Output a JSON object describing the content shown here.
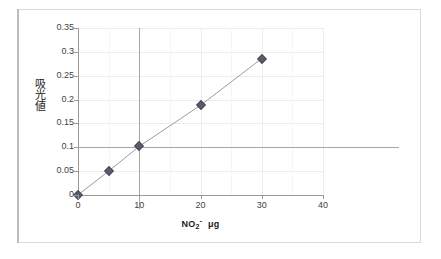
{
  "figure": {
    "background_color": "#ffffff",
    "frame_border_color": "#d9d9d9"
  },
  "chart_data": {
    "type": "line",
    "title": "",
    "subtitle": "",
    "xlabel": "NO2- μg",
    "xlabel_parts": {
      "base": "NO",
      "subscript": "2",
      "superscript": "-",
      "unit": "μg"
    },
    "ylabel": "吸光値",
    "x": [
      0,
      5,
      10,
      20,
      30
    ],
    "values": [
      0,
      0.05,
      0.102,
      0.188,
      0.286
    ],
    "series": [
      {
        "name": "吸光値",
        "x": [
          0,
          5,
          10,
          20,
          30
        ],
        "values": [
          0,
          0.05,
          0.102,
          0.188,
          0.286
        ],
        "marker": "diamond",
        "marker_color": "#5b5b6b",
        "line_color": "#9a9aa6"
      }
    ],
    "xlim": [
      0,
      40
    ],
    "ylim": [
      0,
      0.35
    ],
    "xticks": [
      0,
      10,
      20,
      30,
      40
    ],
    "xtick_labels": [
      "0",
      "10",
      "20",
      "30",
      "40"
    ],
    "yticks": [
      0,
      0.05,
      0.1,
      0.15,
      0.2,
      0.25,
      0.3,
      0.35
    ],
    "ytick_labels": [
      "0",
      "0.05",
      "0.1",
      "0.15",
      "0.2",
      "0.25",
      "0.3",
      "0.35"
    ],
    "grid": true,
    "grid_color": "#ededed",
    "legend": false,
    "legend_position": "none",
    "annotations": [
      {
        "name": "reference-line-horizontal",
        "type": "hline",
        "value": 0.1,
        "color": "#a6a6a6"
      },
      {
        "name": "reference-line-vertical",
        "type": "vline",
        "value": 10,
        "color": "#a6a6a6"
      }
    ],
    "minor_xticks": [
      5,
      15,
      25,
      35
    ]
  }
}
